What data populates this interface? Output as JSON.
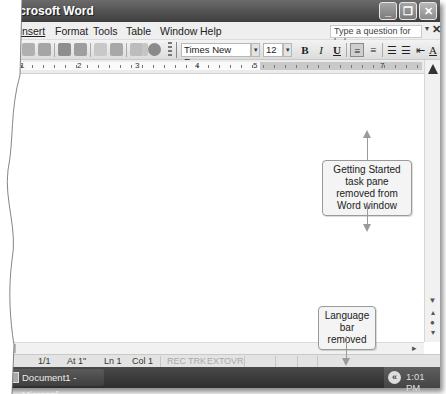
{
  "window": {
    "title": "Microsoft Word",
    "controls": {
      "minimize": "_",
      "restore": "❐",
      "close": "✕"
    }
  },
  "menubar": {
    "items": [
      {
        "label": "v"
      },
      {
        "label": "Insert"
      },
      {
        "label": "Format"
      },
      {
        "label": "Tools"
      },
      {
        "label": "Table"
      },
      {
        "label": "Window"
      },
      {
        "label": "Help"
      }
    ],
    "help_box_placeholder": "Type a question for help",
    "help_arrow": "▾",
    "close_doc": "✕"
  },
  "toolbar": {
    "standard_icons": [
      "save-icon",
      "print-icon",
      "print-preview-icon",
      "spelling-icon",
      "research-icon",
      "cut-icon",
      "paste-icon",
      "undo-icon",
      "undo-dropdown-icon",
      "insert-hyperlink-icon"
    ],
    "font_name": "Times New Roman",
    "font_size": "12",
    "dropdown_arrow": "▾",
    "format_buttons": {
      "bold": "B",
      "italic": "I",
      "underline": "U"
    },
    "align_left": "≡",
    "center": "≡",
    "numbering": "☰",
    "bullets": "☰",
    "decrease_indent": "⇤",
    "font_color": "A"
  },
  "ruler": {
    "numbers": [
      "1",
      "2",
      "3",
      "4",
      "5",
      "7"
    ]
  },
  "scrollbar": {
    "up": "▲",
    "down": "▼",
    "prev_page": "▴",
    "select_browse": "●",
    "next_page": "▾",
    "right": "▸"
  },
  "statusbar": {
    "page": "1/1",
    "at": "At 1\"",
    "line": "Ln 1",
    "col": "Col 1",
    "rec": "REC",
    "trk": "TRK",
    "ext": "EXT",
    "ovr": "OVR"
  },
  "taskbar": {
    "task_label": "Document1 - Microsof...",
    "tray_chevron": "«",
    "clock": "1:01 PM"
  },
  "callouts": {
    "task_pane": "Getting Started task pane removed from Word window",
    "language_bar": "Language bar removed"
  }
}
